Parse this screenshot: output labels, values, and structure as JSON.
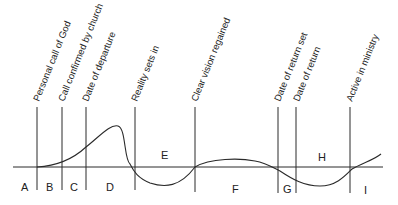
{
  "diagram": {
    "milestones": [
      {
        "label": "Personal call of God",
        "x": 37
      },
      {
        "label": "Call confirmed by church",
        "x": 62
      },
      {
        "label": "Date of departure",
        "x": 86
      },
      {
        "label": "Reality sets in",
        "x": 135
      },
      {
        "label": "Clear vision regained",
        "x": 195
      },
      {
        "label": "Date of return set",
        "x": 278
      },
      {
        "label": "Date of return",
        "x": 296
      },
      {
        "label": "Active in ministry",
        "x": 350
      }
    ],
    "phases": [
      {
        "label": "A",
        "x": 25,
        "y": 190
      },
      {
        "label": "B",
        "x": 49,
        "y": 190
      },
      {
        "label": "C",
        "x": 73,
        "y": 190
      },
      {
        "label": "D",
        "x": 110,
        "y": 190
      },
      {
        "label": "E",
        "x": 165,
        "y": 157
      },
      {
        "label": "F",
        "x": 236,
        "y": 193
      },
      {
        "label": "G",
        "x": 286,
        "y": 193
      },
      {
        "label": "H",
        "x": 322,
        "y": 160
      },
      {
        "label": "I",
        "x": 366,
        "y": 193
      }
    ],
    "colors": {
      "line": "#2a2a2a",
      "text": "#222222",
      "background": "#ffffff"
    }
  }
}
